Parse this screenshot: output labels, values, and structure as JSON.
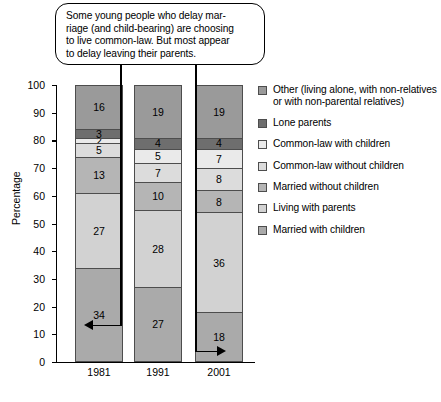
{
  "callout": {
    "text": "Some young people who delay mar-riage (and child-bearing) are choosing to live common-law. But most appear to delay leaving their parents.",
    "line1": "Some young people who delay mar-",
    "line2": "riage (and child-bearing) are choosing",
    "line3": "to live common-law. But most appear",
    "line4": "to delay leaving their parents."
  },
  "chart_data": {
    "type": "bar",
    "stacked": true,
    "title": "",
    "xlabel": "",
    "ylabel": "Percentage",
    "categories": [
      "1981",
      "1991",
      "2001"
    ],
    "ylim": [
      0,
      100
    ],
    "yticks": [
      "0",
      "10",
      "20",
      "30",
      "40",
      "50",
      "60",
      "70",
      "80",
      "90",
      "100"
    ],
    "grid": false,
    "legend_position": "right",
    "stack_order_top_to_bottom": [
      "Other (living alone, with non-relatives or with non-parental relatives)",
      "Lone parents",
      "Common-law with children",
      "Common-law without children",
      "Married without children",
      "Living with parents",
      "Married with children"
    ],
    "series": [
      {
        "name": "Married with children",
        "color": "#aaaaaa",
        "legend_label": "Married with children",
        "values": [
          34,
          27,
          18
        ]
      },
      {
        "name": "Living with parents",
        "color": "#d2d2d2",
        "legend_label": "Living with parents",
        "values": [
          27,
          28,
          36
        ]
      },
      {
        "name": "Married without children",
        "color": "#b5b5b5",
        "legend_label": "Married without children",
        "values": [
          13,
          10,
          8
        ]
      },
      {
        "name": "Common-law without children",
        "color": "#dcdcdc",
        "legend_label": "Common-law without children",
        "values": [
          5,
          7,
          8
        ]
      },
      {
        "name": "Common-law with children",
        "color": "#eaeaea",
        "legend_label": "Common-law with children",
        "values": [
          2,
          5,
          7
        ]
      },
      {
        "name": "Lone parents",
        "color": "#6e6e6e",
        "legend_label": "Lone parents",
        "values": [
          3,
          4,
          4
        ]
      },
      {
        "name": "Other",
        "color": "#9a9a9a",
        "legend_label": "Other (living alone, with non-relatives or with non-parental relatives)",
        "values": [
          16,
          19,
          19
        ]
      }
    ],
    "annotations": [
      {
        "label": "34",
        "points_to": "1981 Married with children"
      },
      {
        "label": "18",
        "points_to": "2001 Married with children"
      }
    ]
  },
  "legend": {
    "items": [
      {
        "label": "Other (living alone, with non-relatives or with non-parental relatives)",
        "color": "#9a9a9a"
      },
      {
        "label": "Lone parents",
        "color": "#6e6e6e"
      },
      {
        "label": "Common-law with children",
        "color": "#eaeaea"
      },
      {
        "label": "Common-law without children",
        "color": "#dcdcdc"
      },
      {
        "label": "Married without children",
        "color": "#b5b5b5"
      },
      {
        "label": "Living with parents",
        "color": "#d2d2d2"
      },
      {
        "label": "Married with children",
        "color": "#aaaaaa"
      }
    ]
  }
}
